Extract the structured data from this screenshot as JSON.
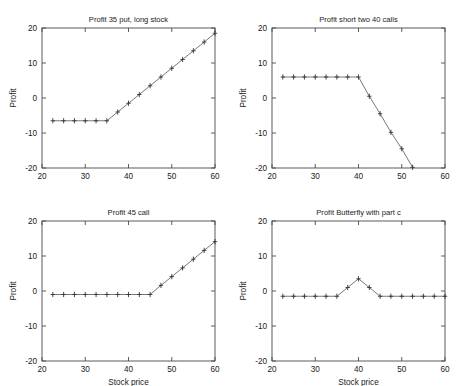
{
  "figure": {
    "background": "#ffffff",
    "axis_color": "#4a4a4a",
    "line_color": "#555555",
    "marker_color": "#333333",
    "marker_style": "plus",
    "rows": 2,
    "cols": 2
  },
  "chart_data": [
    {
      "type": "line",
      "title": "Profit 35 put, long stock",
      "xlabel": "",
      "ylabel": "Profit",
      "xlim": [
        20,
        60
      ],
      "ylim": [
        -20,
        20
      ],
      "xticks": [
        20,
        30,
        40,
        50,
        60
      ],
      "yticks": [
        -20,
        -10,
        0,
        10,
        20
      ],
      "xticklabels": [
        "20",
        "30",
        "40",
        "50",
        "60"
      ],
      "yticklabels": [
        "-20",
        "-10",
        "0",
        "10",
        "20"
      ],
      "grid": false,
      "legend": null,
      "x": [
        22.5,
        25,
        27.5,
        30,
        32.5,
        35,
        37.5,
        40,
        42.5,
        45,
        47.5,
        50,
        52.5,
        55,
        57.5,
        60
      ],
      "y": [
        -6.5,
        -6.5,
        -6.5,
        -6.5,
        -6.5,
        -6.5,
        -4.0,
        -1.5,
        1.0,
        3.5,
        6.0,
        8.5,
        11.0,
        13.5,
        16.0,
        18.5
      ]
    },
    {
      "type": "line",
      "title": "Profit short two 40 calls",
      "xlabel": "",
      "ylabel": "Profit",
      "xlim": [
        20,
        60
      ],
      "ylim": [
        -20,
        20
      ],
      "xticks": [
        20,
        30,
        40,
        50,
        60
      ],
      "yticks": [
        -20,
        -10,
        0,
        10,
        20
      ],
      "xticklabels": [
        "20",
        "30",
        "40",
        "50",
        "60"
      ],
      "yticklabels": [
        "-20",
        "-10",
        "0",
        "10",
        "20"
      ],
      "grid": false,
      "legend": null,
      "x": [
        22.5,
        25,
        27.5,
        30,
        32.5,
        35,
        37.5,
        40,
        42.5,
        45,
        47.5,
        50,
        52.5
      ],
      "y": [
        6.0,
        6.0,
        6.0,
        6.0,
        6.0,
        6.0,
        6.0,
        6.0,
        0.5,
        -4.5,
        -9.8,
        -14.5,
        -19.8
      ]
    },
    {
      "type": "line",
      "title": "Profit 45 call",
      "xlabel": "Stock price",
      "ylabel": "Profit",
      "xlim": [
        20,
        60
      ],
      "ylim": [
        -20,
        20
      ],
      "xticks": [
        20,
        30,
        40,
        50,
        60
      ],
      "yticks": [
        -20,
        -10,
        0,
        10,
        20
      ],
      "xticklabels": [
        "20",
        "30",
        "40",
        "50",
        "60"
      ],
      "yticklabels": [
        "-20",
        "-10",
        "0",
        "10",
        "20"
      ],
      "grid": false,
      "legend": null,
      "x": [
        22.5,
        25,
        27.5,
        30,
        32.5,
        35,
        37.5,
        40,
        42.5,
        45,
        47.5,
        50,
        52.5,
        55,
        57.5,
        60
      ],
      "y": [
        -1.0,
        -1.0,
        -1.0,
        -1.0,
        -1.0,
        -1.0,
        -1.0,
        -1.0,
        -1.0,
        -1.0,
        1.6,
        4.1,
        6.6,
        9.1,
        11.6,
        14.1
      ]
    },
    {
      "type": "line",
      "title": "Profit Butterfly with part c",
      "xlabel": "Stock price",
      "ylabel": "Profit",
      "xlim": [
        20,
        60
      ],
      "ylim": [
        -20,
        20
      ],
      "xticks": [
        20,
        30,
        40,
        50,
        60
      ],
      "yticks": [
        -20,
        -10,
        0,
        10,
        20
      ],
      "xticklabels": [
        "20",
        "30",
        "40",
        "50",
        "60"
      ],
      "yticklabels": [
        "-20",
        "-10",
        "0",
        "10",
        "20"
      ],
      "grid": false,
      "legend": null,
      "x": [
        22.5,
        25,
        27.5,
        30,
        32.5,
        35,
        37.5,
        40,
        42.5,
        45,
        47.5,
        50,
        52.5,
        55,
        57.5,
        60
      ],
      "y": [
        -1.5,
        -1.5,
        -1.5,
        -1.5,
        -1.5,
        -1.5,
        1.0,
        3.5,
        1.0,
        -1.5,
        -1.5,
        -1.5,
        -1.5,
        -1.5,
        -1.5,
        -1.5
      ]
    }
  ]
}
